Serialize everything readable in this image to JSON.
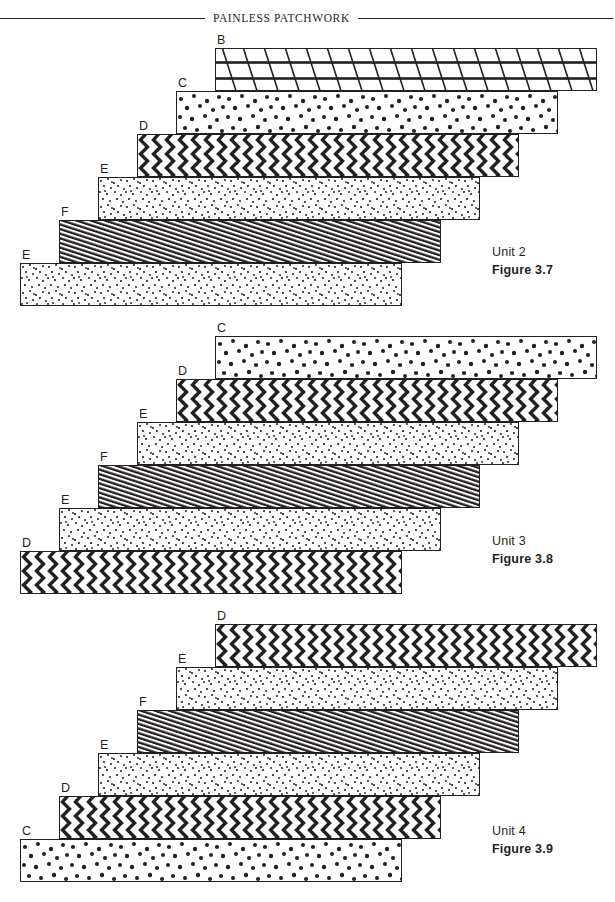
{
  "header": {
    "title": "PAINLESS PATCHWORK"
  },
  "patterns": {
    "B": {
      "name": "diagonal-lattice",
      "description": "lattice of slanted lines with heavy horizontal bars"
    },
    "C": {
      "name": "large-dots",
      "description": "scattered large dots"
    },
    "D": {
      "name": "bold-zigzag",
      "description": "bold vertical zigzag stripes"
    },
    "E": {
      "name": "fine-dots",
      "description": "dense fine dot speckle"
    },
    "F": {
      "name": "diagonal-stripes",
      "description": "tight diagonal stripes"
    }
  },
  "figures": [
    {
      "id": "figure-3-7",
      "unit_label": "Unit 2",
      "figure_label": "Figure 3.7",
      "strips": [
        {
          "label": "B",
          "pattern": "B"
        },
        {
          "label": "C",
          "pattern": "C"
        },
        {
          "label": "D",
          "pattern": "D"
        },
        {
          "label": "E",
          "pattern": "E"
        },
        {
          "label": "F",
          "pattern": "F"
        },
        {
          "label": "E",
          "pattern": "E"
        }
      ]
    },
    {
      "id": "figure-3-8",
      "unit_label": "Unit 3",
      "figure_label": "Figure 3.8",
      "strips": [
        {
          "label": "C",
          "pattern": "C"
        },
        {
          "label": "D",
          "pattern": "D"
        },
        {
          "label": "E",
          "pattern": "E"
        },
        {
          "label": "F",
          "pattern": "F"
        },
        {
          "label": "E",
          "pattern": "E"
        },
        {
          "label": "D",
          "pattern": "D"
        }
      ]
    },
    {
      "id": "figure-3-9",
      "unit_label": "Unit 4",
      "figure_label": "Figure 3.9",
      "strips": [
        {
          "label": "D",
          "pattern": "D"
        },
        {
          "label": "E",
          "pattern": "E"
        },
        {
          "label": "F",
          "pattern": "F"
        },
        {
          "label": "E",
          "pattern": "E"
        },
        {
          "label": "D",
          "pattern": "D"
        },
        {
          "label": "C",
          "pattern": "C"
        }
      ]
    }
  ],
  "layout": {
    "strip_width": 382,
    "strip_height": 43,
    "step_x": 39,
    "top_left_x": 215,
    "group_tops": [
      48,
      336,
      624
    ],
    "caption_x": 492,
    "caption_tops": [
      243,
      532,
      822
    ]
  },
  "colors": {
    "ink": "#231f20",
    "paper": "#ffffff"
  }
}
